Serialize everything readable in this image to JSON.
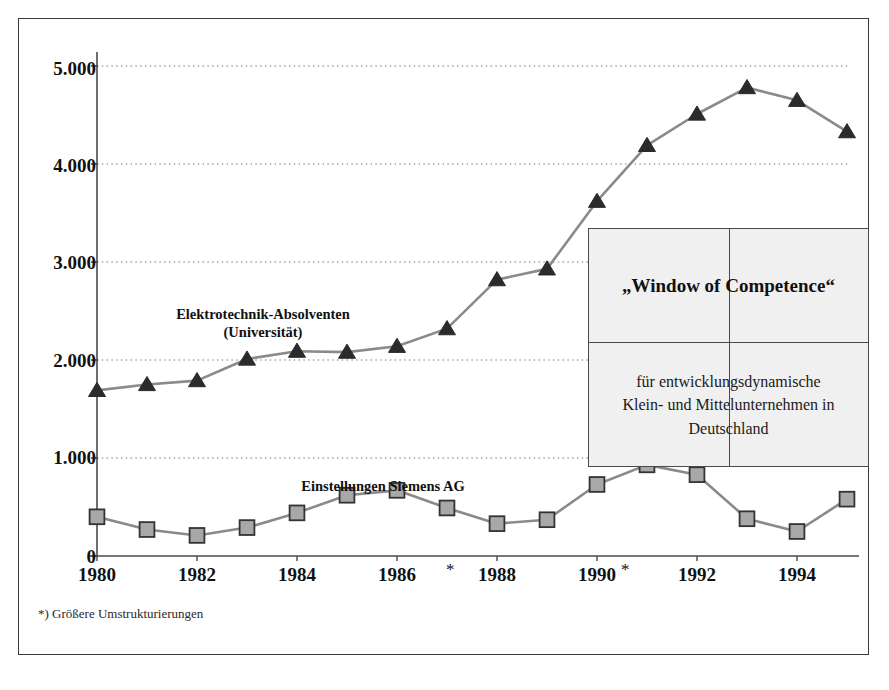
{
  "chart_data": {
    "type": "line",
    "title": "",
    "xlabel": "",
    "ylabel": "",
    "xlim": [
      1980,
      1995
    ],
    "ylim": [
      0,
      5000
    ],
    "grid": true,
    "legend_position": "inline-annotations",
    "y_ticks": [
      "0",
      "1.000",
      "2.000",
      "3.000",
      "4.000",
      "5.000"
    ],
    "y_tick_values": [
      0,
      1000,
      2000,
      3000,
      4000,
      5000
    ],
    "x_ticks": [
      "1980",
      "1982",
      "1984",
      "1986",
      "1988",
      "1990",
      "1992",
      "1994"
    ],
    "x_tick_values": [
      1980,
      1982,
      1984,
      1986,
      1988,
      1990,
      1992,
      1994
    ],
    "x_star_markers": [
      1987,
      1991
    ],
    "x": [
      1980,
      1981,
      1982,
      1983,
      1984,
      1985,
      1986,
      1987,
      1988,
      1989,
      1990,
      1991,
      1992,
      1993,
      1994,
      1995
    ],
    "series": [
      {
        "name": "Elektrotechnik-Absolventen (Universität)",
        "marker": "triangle",
        "color": "#8a8a8a",
        "marker_color": "#2b2b2b",
        "values": [
          1690,
          1750,
          1790,
          2010,
          2090,
          2080,
          2140,
          2320,
          2820,
          2930,
          3620,
          4190,
          4510,
          4780,
          4650,
          4330
        ]
      },
      {
        "name": "Einstellungen Siemens AG",
        "marker": "square",
        "color": "#8a8a8a",
        "marker_color": "#a8a8a8",
        "marker_edge": "#333333",
        "values": [
          400,
          270,
          210,
          290,
          440,
          620,
          670,
          490,
          330,
          370,
          730,
          930,
          830,
          380,
          250,
          580
        ]
      }
    ],
    "annotations": [
      {
        "id": "upper-series-label",
        "text_line1": "Elektrotechnik-Absolventen",
        "text_line2": "(Universität)",
        "x": 1982.4,
        "y": 2560
      },
      {
        "id": "lower-series-label",
        "text": "Einstellungen Siemens AG",
        "x": 1986.4,
        "y": 1080
      }
    ]
  },
  "inset": {
    "title": "„Window of Competence“",
    "body_line1": "für entwicklungsdynamische",
    "body_line2": "Klein- und Mittelunternehmen in",
    "body_line3": "Deutschland"
  },
  "footnote": {
    "text": "*) Größere Umstrukturierungen"
  },
  "colors": {
    "frame": "#3a3a3a",
    "axis": "#4a4a4a",
    "grid": "#6e6e6e",
    "line": "#8a8a8a",
    "triangle_marker": "#2b2b2b",
    "square_marker_fill": "#a8a8a8",
    "square_marker_edge": "#333333",
    "inset_fill": "#f0f0f0",
    "text": "#111111"
  }
}
